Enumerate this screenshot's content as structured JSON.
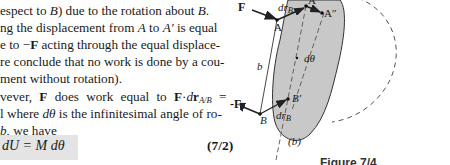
{
  "paragraph": {
    "lines": [
      {
        "pre": "espect to ",
        "var": "B",
        "post": ") due to the rotation about ",
        "var2": "B",
        "end": "."
      },
      {
        "pre": "ng the displacement from ",
        "var": "A",
        "post": " to ",
        "var2": "A′",
        "end": " is equal"
      },
      {
        "pre": "e to −",
        "bold": "F",
        "post": " acting through the equal displace-"
      },
      {
        "text": "re conclude that no work is done by a cou-"
      },
      {
        "text": "ment without rotation)."
      },
      {
        "pre": "vever, ",
        "bold": "F",
        "mid": " does work equal to ",
        "bold2": "F",
        "dot": "·",
        "d": "d",
        "r": "r",
        "sub": "A/B",
        "end": " ="
      },
      {
        "pre": "l where ",
        "var": "dθ",
        "post": " is the infinitesimal angle of ro-"
      },
      {
        "pre": "",
        "var": "b",
        "post": ", we have"
      }
    ]
  },
  "equation": {
    "text": "dU = M dθ",
    "number": "(7/2)"
  },
  "figure": {
    "labels": {
      "F": "F",
      "minusF": "-F",
      "A": "A",
      "Aprime": "A′",
      "Adouble": "A″",
      "B": "B",
      "Bprime": "B′",
      "drB_top": "dr",
      "drB_top_sub": "B",
      "drB_bottom": "dr",
      "drB_bottom_sub": "B",
      "b": "b",
      "dtheta": "dθ",
      "drAB_sub": "A/B",
      "subfig": "(b)",
      "caption": "Figure 7/4"
    },
    "colors": {
      "body_fill": "#c8c8c8",
      "stroke": "#222222",
      "dashed": "#555555"
    }
  }
}
